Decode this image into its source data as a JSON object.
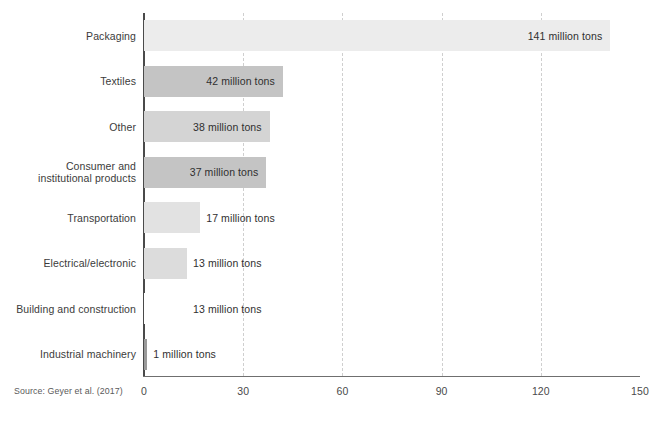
{
  "chart_data": {
    "type": "bar",
    "orientation": "horizontal",
    "title": "",
    "subtitle": "",
    "xlabel": "",
    "ylabel": "",
    "unit": "million tons",
    "xlim": [
      0,
      150
    ],
    "xticks": [
      "0",
      "30",
      "60",
      "90",
      "120",
      "150"
    ],
    "gridlines": [
      30,
      60,
      90,
      120
    ],
    "grid": true,
    "legend": null,
    "categories": [
      "Packaging",
      "Textiles",
      "Other",
      "Consumer and institutional products",
      "Transportation",
      "Electrical/electronic",
      "Building and construction",
      "Industrial machinery"
    ],
    "values": [
      141,
      42,
      38,
      37,
      17,
      13,
      13,
      1
    ],
    "value_labels": [
      "141 million tons",
      "42 million tons",
      "38 million tons",
      "37 million tons",
      "17 million tons",
      "13 million tons",
      "13 million tons",
      "1 million tons"
    ],
    "bar_colors": [
      "#ececec",
      "#c4c4c4",
      "#d4d4d4",
      "#c4c4c4",
      "#e2e2e2",
      "#dcdcdc",
      "#ffffff",
      "#9a9a9a"
    ],
    "source": "Source: Geyer et al. (2017)"
  },
  "rows": [
    {
      "label_line1": "Packaging",
      "label_line2": "",
      "value_label": "141 million tons",
      "value": 141,
      "color": "#ececec",
      "label_inside": true
    },
    {
      "label_line1": "Textiles",
      "label_line2": "",
      "value_label": "42 million tons",
      "value": 42,
      "color": "#c4c4c4",
      "label_inside": true
    },
    {
      "label_line1": "Other",
      "label_line2": "",
      "value_label": "38 million tons",
      "value": 38,
      "color": "#d4d4d4",
      "label_inside": true
    },
    {
      "label_line1": "Consumer and",
      "label_line2": "institutional products",
      "value_label": "37 million tons",
      "value": 37,
      "color": "#c4c4c4",
      "label_inside": true
    },
    {
      "label_line1": "Transportation",
      "label_line2": "",
      "value_label": "17 million tons",
      "value": 17,
      "color": "#e2e2e2",
      "label_inside": false
    },
    {
      "label_line1": "Electrical/electronic",
      "label_line2": "",
      "value_label": "13 million tons",
      "value": 13,
      "color": "#dcdcdc",
      "label_inside": false
    },
    {
      "label_line1": "Building and construction",
      "label_line2": "",
      "value_label": "13 million tons",
      "value": 13,
      "color": "#ffffff",
      "label_inside": false
    },
    {
      "label_line1": "Industrial machinery",
      "label_line2": "",
      "value_label": "1 million tons",
      "value": 1,
      "color": "#9a9a9a",
      "label_inside": false
    }
  ],
  "axis": {
    "ticks": [
      "0",
      "30",
      "60",
      "90",
      "120",
      "150"
    ],
    "tick_values": [
      0,
      30,
      60,
      90,
      120,
      150
    ]
  },
  "footer": {
    "source": "Source: Geyer et al. (2017)"
  },
  "colors": {
    "axis": "#4a4a4a",
    "baseline": "#6f6f6f",
    "gridline": "#cfcfcf",
    "text": "#3b3b3b",
    "background": "#ffffff"
  }
}
